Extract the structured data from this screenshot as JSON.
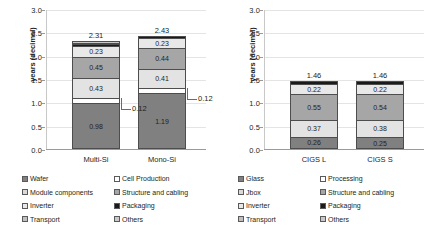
{
  "axis": {
    "ylabel": "years (decimal)",
    "yticks": [
      "3.0",
      "2.5",
      "2.0",
      "1.5",
      "1.0",
      "0.5",
      "0.0"
    ],
    "ymin": 0.0,
    "ymax": 3.0
  },
  "left_panel": {
    "categories": [
      "Multi-Si",
      "Mono-Si"
    ],
    "totals": [
      "2.31",
      "2.43"
    ],
    "callouts": [
      "0.12",
      "0.12"
    ],
    "legend": [
      {
        "label": "Wafer",
        "color": "#808080"
      },
      {
        "label": "Cell Production",
        "color": "#ffffff"
      },
      {
        "label": "Module components",
        "color": "#d9d9d9"
      },
      {
        "label": "Structure and cabling",
        "color": "#a6a6a6"
      },
      {
        "label": "Inverter",
        "color": "#e8e8e8"
      },
      {
        "label": "Packaging",
        "color": "#1a1a1a"
      },
      {
        "label": "Transport",
        "color": "#bfbfbf"
      },
      {
        "label": "Others",
        "color": "#c9c9c9"
      }
    ]
  },
  "right_panel": {
    "categories": [
      "CIGS L",
      "CIGS S"
    ],
    "totals": [
      "1.46",
      "1.46"
    ],
    "legend": [
      {
        "label": "Glass",
        "color": "#808080"
      },
      {
        "label": "Processing",
        "color": "#ffffff"
      },
      {
        "label": "Jbox",
        "color": "#d9d9d9"
      },
      {
        "label": "Structure and cabling",
        "color": "#a6a6a6"
      },
      {
        "label": "Inverter",
        "color": "#e8e8e8"
      },
      {
        "label": "Packaging",
        "color": "#1a1a1a"
      },
      {
        "label": "Transport",
        "color": "#bfbfbf"
      },
      {
        "label": "Others",
        "color": "#c9c9c9"
      }
    ]
  },
  "chart_data": [
    {
      "type": "bar",
      "stacked": true,
      "title": "",
      "xlabel": "",
      "ylabel": "years (decimal)",
      "ylim": [
        0.0,
        3.0
      ],
      "ytick_step": 0.5,
      "grid": true,
      "legend_position": "bottom",
      "categories": [
        "Multi-Si",
        "Mono-Si"
      ],
      "totals": [
        2.31,
        2.43
      ],
      "series": [
        {
          "name": "Wafer",
          "values": [
            0.98,
            1.19
          ],
          "color": "#808080",
          "label_shown": true
        },
        {
          "name": "Cell Production",
          "values": [
            0.12,
            0.12
          ],
          "color": "#ffffff",
          "label_shown": true,
          "label_as_callout": true
        },
        {
          "name": "Module components",
          "values": [
            0.43,
            0.41
          ],
          "color": "#e3e3e3",
          "label_shown": true
        },
        {
          "name": "Structure and cabling",
          "values": [
            0.45,
            0.44
          ],
          "color": "#a6a6a6",
          "label_shown": true
        },
        {
          "name": "Inverter",
          "values": [
            0.23,
            0.23
          ],
          "color": "#e8e8e8",
          "label_shown": true
        },
        {
          "name": "Packaging",
          "values": [
            0.04,
            0.04
          ],
          "color": "#1a1a1a",
          "label_shown": false
        },
        {
          "name": "Transport",
          "values": [
            0.03,
            0.0
          ],
          "color": "#bfbfbf",
          "label_shown": false
        },
        {
          "name": "Others",
          "values": [
            0.03,
            0.0
          ],
          "color": "#c9c9c9",
          "label_shown": false
        }
      ]
    },
    {
      "type": "bar",
      "stacked": true,
      "title": "",
      "xlabel": "",
      "ylabel": "years (decimal)",
      "ylim": [
        0.0,
        3.0
      ],
      "ytick_step": 0.5,
      "grid": true,
      "legend_position": "bottom",
      "categories": [
        "CIGS L",
        "CIGS S"
      ],
      "totals": [
        1.46,
        1.46
      ],
      "series": [
        {
          "name": "Glass",
          "values": [
            0.26,
            0.25
          ],
          "color": "#808080",
          "label_shown": true
        },
        {
          "name": "Processing",
          "values": [
            0.37,
            0.38
          ],
          "color": "#e3e3e3",
          "label_shown": true
        },
        {
          "name": "Jbox",
          "values": [
            0.55,
            0.54
          ],
          "color": "#a6a6a6",
          "label_shown": true
        },
        {
          "name": "Structure and cabling",
          "values": [
            0.22,
            0.22
          ],
          "color": "#e8e8e8",
          "label_shown": true
        },
        {
          "name": "Packaging",
          "values": [
            0.06,
            0.07
          ],
          "color": "#1a1a1a",
          "label_shown": false
        }
      ]
    }
  ]
}
